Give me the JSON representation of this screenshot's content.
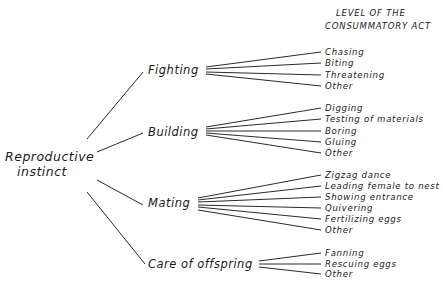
{
  "header": {
    "line1": "LEVEL OF THE",
    "line2": "CONSUMMATORY ACT"
  },
  "root": {
    "line1": "Reproductive",
    "line2": "instinct"
  },
  "categories": [
    {
      "label": "Fighting",
      "acts": [
        "Chasing",
        "Biting",
        "Threatening",
        "Other"
      ]
    },
    {
      "label": "Building",
      "acts": [
        "Digging",
        "Testing of materials",
        "Boring",
        "Gluing",
        "Other"
      ]
    },
    {
      "label": "Mating",
      "acts": [
        "Zigzag dance",
        "Leading female to nest",
        "Showing entrance",
        "Quivering",
        "Fertilizing eggs",
        "Other"
      ]
    },
    {
      "label": "Care of offspring",
      "acts": [
        "Fanning",
        "Rescuing eggs",
        "Other"
      ]
    }
  ],
  "colors": {
    "line": "#2a2a2a",
    "text": "#1a1a1a",
    "background": "#ffffff"
  }
}
